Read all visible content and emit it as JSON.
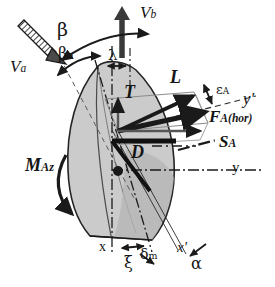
{
  "figure": {
    "type": "vector-force-diagram",
    "background_color": "#ffffff",
    "ink_color": "#151515",
    "body_fill_color": "#c9c9c9",
    "body_stroke_color": "#1a1a1a"
  },
  "labels": {
    "v_a": {
      "base": "V",
      "sub": "a",
      "x": 10,
      "y": 60,
      "size": 17
    },
    "v_b": {
      "base": "V",
      "sub": "b",
      "x": 140,
      "y": 5,
      "size": 17
    },
    "beta": {
      "base": "β",
      "sub": "",
      "x": 57,
      "y": 22,
      "size": 17
    },
    "beta_a": {
      "base": "β",
      "sub": "a",
      "x": 60,
      "y": 48,
      "size": 15
    },
    "lambda": {
      "base": "λ",
      "sub": "",
      "x": 101,
      "y": 52,
      "size": 14
    },
    "thrust": {
      "base": "T",
      "sub": "",
      "x": 124,
      "y": 85,
      "size": 17
    },
    "lift": {
      "base": "L",
      "sub": "",
      "x": 172,
      "y": 70,
      "size": 17
    },
    "epsilon_a": {
      "base": "ε",
      "sub": "A",
      "x": 218,
      "y": 85,
      "size": 13
    },
    "f_a_hor": {
      "base": "F",
      "sub": "A(hor)",
      "x": 212,
      "y": 112,
      "size": 16
    },
    "y_prime": {
      "base": "y",
      "sub": "'",
      "x": 243,
      "y": 92,
      "size": 16
    },
    "s_a": {
      "base": "S",
      "sub": "A",
      "x": 220,
      "y": 137,
      "size": 16
    },
    "y_axis": {
      "base": "y",
      "sub": "",
      "x": 232,
      "y": 163,
      "size": 15
    },
    "drag": {
      "base": "D",
      "sub": "",
      "x": 132,
      "y": 146,
      "size": 17
    },
    "m_az": {
      "base": "M",
      "sub": "Az",
      "x": 26,
      "y": 158,
      "size": 17
    },
    "x_axis": {
      "base": "x",
      "sub": "",
      "x": 100,
      "y": 243,
      "size": 14
    },
    "xi": {
      "base": "ξ",
      "sub": "",
      "x": 125,
      "y": 258,
      "size": 15
    },
    "delta_m": {
      "base": "δ",
      "sub": "m",
      "x": 142,
      "y": 248,
      "size": 14
    },
    "x_prime": {
      "base": "x",
      "sub": "'",
      "x": 178,
      "y": 243,
      "size": 14
    },
    "alpha": {
      "base": "α",
      "sub": "",
      "x": 192,
      "y": 259,
      "size": 15
    }
  },
  "vectors": [
    {
      "name": "V_a",
      "style": "hatched",
      "from": [
        22,
        22
      ],
      "to": [
        62,
        60
      ]
    },
    {
      "name": "V_b",
      "style": "solid-thick",
      "from": [
        122,
        58
      ],
      "to": [
        122,
        8
      ]
    },
    {
      "name": "T",
      "style": "solid",
      "from": [
        118,
        131
      ],
      "to": [
        118,
        97
      ]
    },
    {
      "name": "L",
      "style": "solid-thick",
      "from": [
        118,
        131
      ],
      "to": [
        196,
        95
      ]
    },
    {
      "name": "F_A(hor)",
      "style": "solid-thick",
      "from": [
        118,
        131
      ],
      "to": [
        210,
        111
      ]
    },
    {
      "name": "S_A",
      "style": "solid",
      "from": [
        118,
        131
      ],
      "to": [
        205,
        131
      ]
    },
    {
      "name": "D",
      "style": "solid-thick",
      "from": [
        114,
        118
      ],
      "to": [
        160,
        118
      ]
    }
  ],
  "axes": [
    {
      "name": "x",
      "style": "dash-dot",
      "orientation": "vertical"
    },
    {
      "name": "y",
      "style": "dash-dot",
      "orientation": "horizontal"
    },
    {
      "name": "x'",
      "style": "solid-thin",
      "orientation": "tilted"
    },
    {
      "name": "y'",
      "style": "dashed",
      "orientation": "tilted"
    }
  ],
  "angles": [
    {
      "name": "beta",
      "style": "double-arc-arrow"
    },
    {
      "name": "beta_a",
      "style": "double-arc-arrow"
    },
    {
      "name": "lambda",
      "style": "double-head-arrow"
    },
    {
      "name": "epsilon_A",
      "style": "double-head-arrow"
    },
    {
      "name": "delta_m",
      "style": "double-head-arrow"
    },
    {
      "name": "alpha",
      "style": "double-head-arrow"
    },
    {
      "name": "M_Az",
      "style": "curved-moment-arrow"
    }
  ]
}
